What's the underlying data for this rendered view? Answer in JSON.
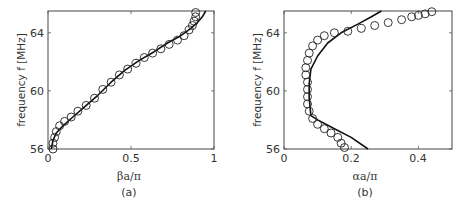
{
  "chart_data": [
    {
      "type": "scatter",
      "panel": "(a)",
      "title": "",
      "xlabel": "βa/π",
      "ylabel": "frequency f [MHz]",
      "xlim": [
        0,
        1
      ],
      "ylim": [
        56,
        65.5
      ],
      "xticks": [
        "0",
        "0.5",
        "1"
      ],
      "yticks": [
        "56",
        "60",
        "64"
      ],
      "grid": false,
      "series": [
        {
          "name": "theory (solid line)",
          "style": "line",
          "x": [
            0.02,
            0.03,
            0.05,
            0.09,
            0.15,
            0.22,
            0.3,
            0.38,
            0.46,
            0.55,
            0.64,
            0.72,
            0.8,
            0.86,
            0.9,
            0.93,
            0.95
          ],
          "y": [
            56.0,
            56.6,
            57.1,
            57.6,
            58.2,
            58.9,
            59.7,
            60.6,
            61.4,
            62.1,
            62.7,
            63.3,
            63.8,
            64.3,
            64.7,
            65.1,
            65.5
          ]
        },
        {
          "name": "measured (circles)",
          "style": "markers",
          "x": [
            0.03,
            0.03,
            0.04,
            0.05,
            0.07,
            0.1,
            0.14,
            0.18,
            0.23,
            0.28,
            0.33,
            0.38,
            0.43,
            0.48,
            0.53,
            0.58,
            0.63,
            0.68,
            0.73,
            0.78,
            0.82,
            0.85,
            0.87,
            0.88,
            0.89,
            0.89
          ],
          "y": [
            56.0,
            56.4,
            56.8,
            57.2,
            57.6,
            57.9,
            58.2,
            58.6,
            59.0,
            59.5,
            60.1,
            60.6,
            61.1,
            61.5,
            61.9,
            62.3,
            62.6,
            62.9,
            63.2,
            63.5,
            63.8,
            64.2,
            64.5,
            64.8,
            65.1,
            65.4
          ]
        }
      ]
    },
    {
      "type": "scatter",
      "panel": "(b)",
      "title": "",
      "xlabel": "αa/π",
      "ylabel": "frequency f [MHz]",
      "xlim": [
        0,
        0.5
      ],
      "ylim": [
        56,
        65.5
      ],
      "xticks": [
        "0",
        "0.2",
        "0.4"
      ],
      "yticks": [
        "56",
        "60",
        "64"
      ],
      "grid": false,
      "series": [
        {
          "name": "theory (solid line)",
          "style": "line",
          "x": [
            0.25,
            0.2,
            0.15,
            0.1,
            0.08,
            0.075,
            0.075,
            0.08,
            0.1,
            0.13,
            0.17,
            0.22,
            0.26,
            0.29
          ],
          "y": [
            56.0,
            56.8,
            57.4,
            58.0,
            58.3,
            59.5,
            60.5,
            61.5,
            62.4,
            63.3,
            64.0,
            64.6,
            65.1,
            65.5
          ]
        },
        {
          "name": "measured (circles)",
          "style": "markers",
          "x": [
            0.18,
            0.17,
            0.16,
            0.14,
            0.12,
            0.1,
            0.085,
            0.075,
            0.07,
            0.07,
            0.07,
            0.07,
            0.065,
            0.065,
            0.07,
            0.075,
            0.085,
            0.1,
            0.12,
            0.15,
            0.19,
            0.23,
            0.27,
            0.31,
            0.35,
            0.38,
            0.4,
            0.42,
            0.44
          ],
          "y": [
            56.1,
            56.4,
            56.8,
            57.1,
            57.4,
            57.7,
            58.1,
            58.6,
            59.1,
            59.6,
            60.1,
            60.6,
            61.1,
            61.6,
            62.1,
            62.6,
            63.1,
            63.5,
            63.8,
            64.0,
            64.1,
            64.3,
            64.5,
            64.7,
            64.9,
            65.1,
            65.2,
            65.3,
            65.45
          ]
        }
      ]
    }
  ],
  "panels": {
    "a": {
      "caption": "(a)",
      "xlabel": "βa/π",
      "ylabel": "frequency f [MHz]",
      "xticks": [
        "0",
        "0.5",
        "1"
      ],
      "yticks": [
        "56",
        "60",
        "64"
      ]
    },
    "b": {
      "caption": "(b)",
      "xlabel": "αa/π",
      "ylabel": "frequency f [MHz]",
      "xticks": [
        "0",
        "0.2",
        "0.4"
      ],
      "yticks": [
        "56",
        "60",
        "64"
      ]
    }
  }
}
